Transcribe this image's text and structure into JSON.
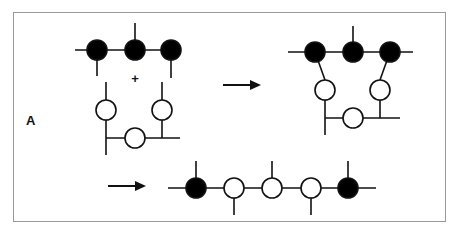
{
  "figure": {
    "panel_label": "A",
    "plus_sign": "+",
    "colors": {
      "filled": "#000000",
      "open": "#ffffff",
      "stroke": "#111111",
      "frame": "#9a9a9a"
    }
  },
  "reactants": {
    "filled_chain": {
      "nodes": [
        "filled",
        "filled",
        "filled"
      ]
    },
    "open_chain": {
      "nodes": [
        "open",
        "open",
        "open"
      ]
    }
  },
  "product_1": {
    "filled_nodes": 3,
    "open_nodes": 3,
    "description": "fused loop structure"
  },
  "product_2": {
    "nodes": [
      "filled",
      "open",
      "open",
      "open",
      "filled"
    ],
    "description": "linear chain"
  },
  "arrows": [
    {
      "label": ""
    },
    {
      "label": ""
    }
  ]
}
